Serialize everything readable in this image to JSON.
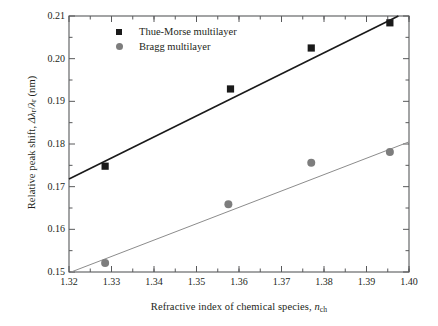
{
  "chart_data": {
    "type": "scatter",
    "title": "",
    "xlabel": "Refractive index of chemical species, n_ch",
    "ylabel": "Relative peak shift, Δλ_r/λ_r (nm)",
    "xlim": [
      1.32,
      1.4
    ],
    "ylim": [
      0.15,
      0.21
    ],
    "xticks": [
      "1.32",
      "1.33",
      "1.34",
      "1.35",
      "1.36",
      "1.37",
      "1.38",
      "1.39",
      "1.40"
    ],
    "xtick_values": [
      1.32,
      1.33,
      1.34,
      1.35,
      1.36,
      1.37,
      1.38,
      1.39,
      1.4
    ],
    "yticks": [
      "0.15",
      "0.16",
      "0.17",
      "0.18",
      "0.19",
      "0.20",
      "0.21"
    ],
    "ytick_values": [
      0.15,
      0.16,
      0.17,
      0.18,
      0.19,
      0.2,
      0.21
    ],
    "minor_tick_step_x": 0.005,
    "minor_tick_step_y": 0.005,
    "grid": false,
    "legend_position": "top-left-inside",
    "series": [
      {
        "name": "Thue-Morse multilayer",
        "marker": "square",
        "color": "#1a1a1a",
        "x": [
          1.3285,
          1.358,
          1.377,
          1.3955
        ],
        "y": [
          0.1748,
          0.1929,
          0.2025,
          0.2084
        ],
        "fit_line": {
          "x": [
            1.32,
            1.3975
          ],
          "y": [
            0.1718,
            0.21
          ],
          "color": "#1a1a1a",
          "width": 1.6
        }
      },
      {
        "name": "Bragg multilayer",
        "marker": "circle",
        "color": "#7d7d7d",
        "x": [
          1.3285,
          1.3575,
          1.377,
          1.3955
        ],
        "y": [
          0.1521,
          0.1659,
          0.1756,
          0.1781
        ],
        "fit_line": {
          "x": [
            1.3205,
            1.4
          ],
          "y": [
            0.15,
            0.1805
          ],
          "color": "#8c8c8c",
          "width": 1.0
        }
      }
    ]
  },
  "axes": {
    "ylabel_parts": {
      "lead": "Relative peak shift, ",
      "delta": "Δλ",
      "sub1": "r",
      "slash": "/",
      "lam": "λ",
      "sub2": "r",
      "units": " (nm)"
    },
    "xlabel_parts": {
      "lead": "Refractive index of chemical species, ",
      "symbol": "n",
      "sub": "ch"
    }
  },
  "legend": {
    "items": [
      {
        "label": "Thue-Morse multilayer",
        "marker": "square-marker",
        "color": "#1a1a1a"
      },
      {
        "label": "Bragg multilayer",
        "marker": "circle-marker",
        "color": "#7d7d7d"
      }
    ]
  },
  "frame": {
    "color": "#58595b",
    "width": 1.1
  }
}
